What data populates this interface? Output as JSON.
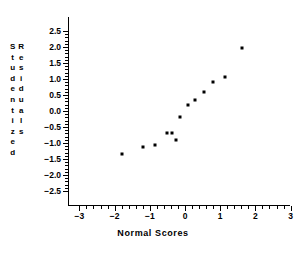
{
  "chart_data": {
    "type": "scatter",
    "title": "",
    "xlabel": "Normal Scores",
    "ylabel": "Studentized Residuals",
    "ylabel_columns": [
      "Studentized",
      "Residuals"
    ],
    "xlim": [
      -3,
      3
    ],
    "ylim": [
      -2.5,
      2.5
    ],
    "xticks": [
      -3,
      -2,
      -1,
      0,
      1,
      2,
      3
    ],
    "xtick_labels": [
      "−3",
      "−2",
      "−1",
      "0",
      "1",
      "2",
      "3"
    ],
    "yticks": [
      2.5,
      2.0,
      1.5,
      1.0,
      0.5,
      0.0,
      -0.5,
      -1.0,
      -1.5,
      -2.0,
      -2.5
    ],
    "ytick_labels": [
      "2.5",
      "2.0",
      "1.5",
      "1.0",
      "0.5",
      "0.0",
      "−0.5",
      "−1.0",
      "−1.5",
      "−2.0",
      "−2.5"
    ],
    "grid": false,
    "legend": false,
    "marker": "square",
    "marker_color": "#000000",
    "point_count": 13,
    "x": [
      -1.8,
      -1.19,
      -0.85,
      -0.5,
      -0.37,
      -0.26,
      -0.13,
      0.09,
      0.29,
      0.54,
      0.8,
      1.15,
      1.63
    ],
    "y": [
      -1.34,
      -1.13,
      -1.06,
      -0.7,
      -0.68,
      -0.92,
      -0.19,
      0.19,
      0.34,
      0.6,
      0.91,
      1.06,
      1.97
    ],
    "points": [
      {
        "x": -1.8,
        "y": -1.34
      },
      {
        "x": -1.19,
        "y": -1.13
      },
      {
        "x": -0.85,
        "y": -1.06
      },
      {
        "x": -0.5,
        "y": -0.7
      },
      {
        "x": -0.37,
        "y": -0.68
      },
      {
        "x": -0.26,
        "y": -0.92
      },
      {
        "x": -0.13,
        "y": -0.19
      },
      {
        "x": 0.09,
        "y": 0.19
      },
      {
        "x": 0.29,
        "y": 0.34
      },
      {
        "x": 0.54,
        "y": 0.6
      },
      {
        "x": 0.8,
        "y": 0.91
      },
      {
        "x": 1.15,
        "y": 1.06
      },
      {
        "x": 1.63,
        "y": 1.97
      }
    ]
  }
}
